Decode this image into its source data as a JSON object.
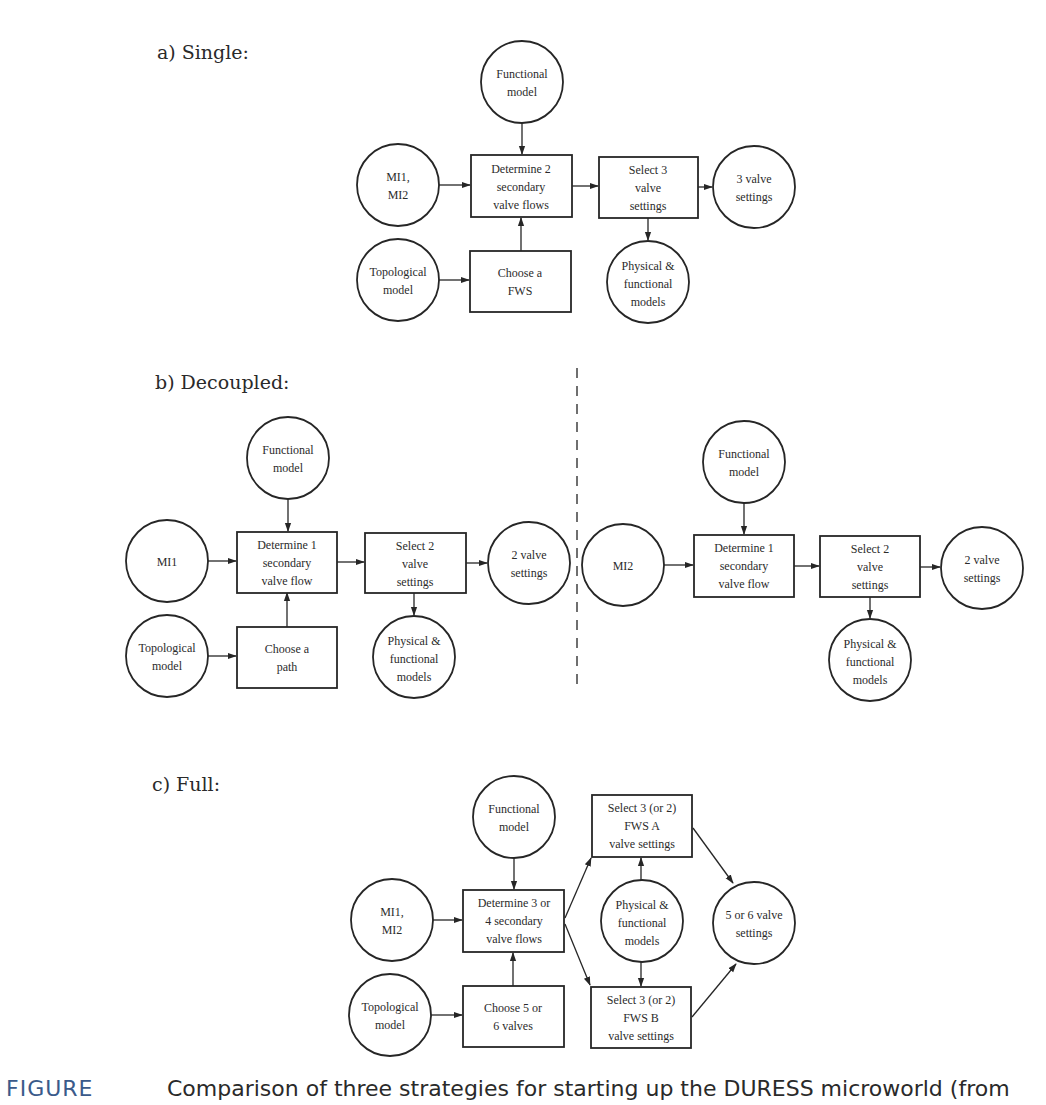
{
  "sections": {
    "a": {
      "label": "a) Single:",
      "nodes": {
        "functional": [
          "Functional",
          "model"
        ],
        "inputs": [
          "MI1,",
          "MI2"
        ],
        "topological": [
          "Topological",
          "model"
        ],
        "determine": [
          "Determine 2",
          "secondary",
          "valve flows"
        ],
        "choose": [
          "Choose a",
          "FWS"
        ],
        "select": [
          "Select 3",
          "valve",
          "settings"
        ],
        "physical": [
          "Physical &",
          "functional",
          "models"
        ],
        "output": [
          "3 valve",
          "settings"
        ]
      }
    },
    "b": {
      "label": "b) Decoupled:",
      "left": {
        "functional": [
          "Functional",
          "model"
        ],
        "inputs": [
          "MI1"
        ],
        "topological": [
          "Topological",
          "model"
        ],
        "determine": [
          "Determine 1",
          "secondary",
          "valve flow"
        ],
        "choose": [
          "Choose a",
          "path"
        ],
        "select": [
          "Select 2",
          "valve",
          "settings"
        ],
        "physical": [
          "Physical &",
          "functional",
          "models"
        ],
        "output": [
          "2 valve",
          "settings"
        ]
      },
      "right": {
        "functional": [
          "Functional",
          "model"
        ],
        "inputs": [
          "MI2"
        ],
        "determine": [
          "Determine 1",
          "secondary",
          "valve flow"
        ],
        "select": [
          "Select 2",
          "valve",
          "settings"
        ],
        "physical": [
          "Physical &",
          "functional",
          "models"
        ],
        "output": [
          "2 valve",
          "settings"
        ]
      }
    },
    "c": {
      "label": "c) Full:",
      "nodes": {
        "functional": [
          "Functional",
          "model"
        ],
        "inputs": [
          "MI1,",
          "MI2"
        ],
        "topological": [
          "Topological",
          "model"
        ],
        "determine": [
          "Determine 3 or",
          "4 secondary",
          "valve flows"
        ],
        "choose": [
          "Choose 5 or",
          "6 valves"
        ],
        "select_a": [
          "Select 3 (or 2)",
          "FWS A",
          "valve settings"
        ],
        "select_b": [
          "Select 3 (or 2)",
          "FWS B",
          "valve settings"
        ],
        "physical": [
          "Physical &",
          "functional",
          "models"
        ],
        "output": [
          "5 or 6 valve",
          "settings"
        ]
      }
    }
  },
  "caption": {
    "tag": "FIGURE",
    "text": "Comparison of three strategies for starting up the DURESS microworld (from"
  }
}
